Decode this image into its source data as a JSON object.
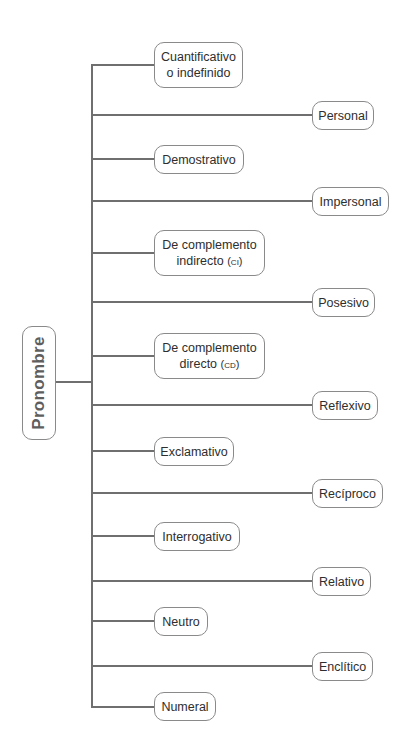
{
  "diagram": {
    "root": {
      "label": "Pronombre"
    },
    "colors": {
      "line": "#6f6f6f",
      "border": "#8a8a8a",
      "text": "#2e2e2e",
      "root_text": "#5e5e5e"
    },
    "branches": [
      {
        "id": "cuantificativo",
        "side": "left",
        "line1": "Cuantificativo",
        "line2": "o indefinido",
        "abbr": ""
      },
      {
        "id": "personal",
        "side": "right",
        "line1": "Personal",
        "line2": "",
        "abbr": ""
      },
      {
        "id": "demostrativo",
        "side": "left",
        "line1": "Demostrativo",
        "line2": "",
        "abbr": ""
      },
      {
        "id": "impersonal",
        "side": "right",
        "line1": "Impersonal",
        "line2": "",
        "abbr": ""
      },
      {
        "id": "complemento-indirecto",
        "side": "left",
        "line1": "De complemento",
        "line2": "indirecto",
        "abbr": "(ci)"
      },
      {
        "id": "posesivo",
        "side": "right",
        "line1": "Posesivo",
        "line2": "",
        "abbr": ""
      },
      {
        "id": "complemento-directo",
        "side": "left",
        "line1": "De complemento",
        "line2": "directo",
        "abbr": "(cd)"
      },
      {
        "id": "reflexivo",
        "side": "right",
        "line1": "Reflexivo",
        "line2": "",
        "abbr": ""
      },
      {
        "id": "exclamativo",
        "side": "left",
        "line1": "Exclamativo",
        "line2": "",
        "abbr": ""
      },
      {
        "id": "reciproco",
        "side": "right",
        "line1": "Recíproco",
        "line2": "",
        "abbr": ""
      },
      {
        "id": "interrogativo",
        "side": "left",
        "line1": "Interrogativo",
        "line2": "",
        "abbr": ""
      },
      {
        "id": "relativo",
        "side": "right",
        "line1": "Relativo",
        "line2": "",
        "abbr": ""
      },
      {
        "id": "neutro",
        "side": "left",
        "line1": "Neutro",
        "line2": "",
        "abbr": ""
      },
      {
        "id": "enclitico",
        "side": "right",
        "line1": "Enclítico",
        "line2": "",
        "abbr": ""
      },
      {
        "id": "numeral",
        "side": "left",
        "line1": "Numeral",
        "line2": "",
        "abbr": ""
      }
    ]
  }
}
